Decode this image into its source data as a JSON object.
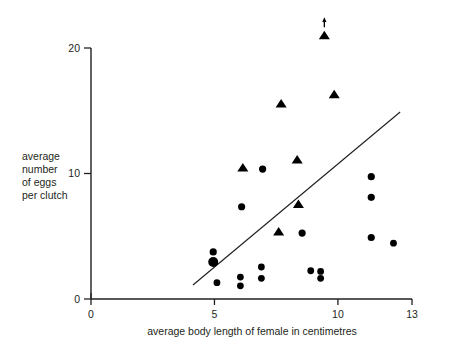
{
  "chart_data": {
    "type": "scatter",
    "title": "",
    "xlabel": "average body length of female in centimetres",
    "ylabel": "average number of eggs per clutch",
    "ylabel_lines": [
      "average",
      "number",
      "of eggs",
      "per clutch"
    ],
    "xlim": [
      0,
      13
    ],
    "ylim": [
      0,
      21.8
    ],
    "xticks": [
      0,
      5,
      10,
      13
    ],
    "xtick_labels": [
      "0",
      "5",
      "10",
      "13"
    ],
    "yticks": [
      0,
      10,
      20
    ],
    "ytick_labels": [
      "0",
      "10",
      "20"
    ],
    "grid": false,
    "legend": "none",
    "series": [
      {
        "name": "circles",
        "marker": "circle",
        "color": "#000000",
        "points": [
          {
            "x": 4.95,
            "y": 3.75,
            "r": 3.6
          },
          {
            "x": 4.95,
            "y": 2.95,
            "r": 5.0
          },
          {
            "x": 5.1,
            "y": 1.3,
            "r": 3.4
          },
          {
            "x": 6.1,
            "y": 7.35,
            "r": 3.6
          },
          {
            "x": 6.05,
            "y": 1.75,
            "r": 3.4
          },
          {
            "x": 6.05,
            "y": 1.05,
            "r": 3.4
          },
          {
            "x": 6.95,
            "y": 10.35,
            "r": 3.6
          },
          {
            "x": 6.9,
            "y": 2.55,
            "r": 3.4
          },
          {
            "x": 6.9,
            "y": 1.65,
            "r": 3.4
          },
          {
            "x": 8.55,
            "y": 5.25,
            "r": 3.6
          },
          {
            "x": 8.9,
            "y": 2.25,
            "r": 3.4
          },
          {
            "x": 9.3,
            "y": 2.2,
            "r": 3.4
          },
          {
            "x": 9.3,
            "y": 1.65,
            "r": 3.4
          },
          {
            "x": 11.35,
            "y": 9.75,
            "r": 3.6
          },
          {
            "x": 11.35,
            "y": 8.1,
            "r": 3.6
          },
          {
            "x": 11.35,
            "y": 4.9,
            "r": 3.6
          },
          {
            "x": 12.25,
            "y": 4.45,
            "r": 3.4
          }
        ]
      },
      {
        "name": "triangles",
        "marker": "triangle",
        "color": "#000000",
        "points": [
          {
            "x": 6.15,
            "y": 10.45,
            "s": 6.0
          },
          {
            "x": 7.7,
            "y": 15.55,
            "s": 6.0
          },
          {
            "x": 7.6,
            "y": 5.35,
            "s": 6.0
          },
          {
            "x": 8.35,
            "y": 11.1,
            "s": 6.0
          },
          {
            "x": 8.4,
            "y": 7.55,
            "s": 6.0
          },
          {
            "x": 9.45,
            "y": 21.0,
            "s": 6.0,
            "annotation": "up-arrow"
          },
          {
            "x": 9.85,
            "y": 16.3,
            "s": 6.0
          }
        ]
      }
    ],
    "trend_line": {
      "name": "fitted-line",
      "x1": 4.13,
      "y1": 1.12,
      "x2": 12.52,
      "y2": 14.9
    },
    "annotations": [
      {
        "name": "off-scale-arrow",
        "type": "up-arrow",
        "x": 9.45,
        "y": 22.0
      }
    ]
  }
}
